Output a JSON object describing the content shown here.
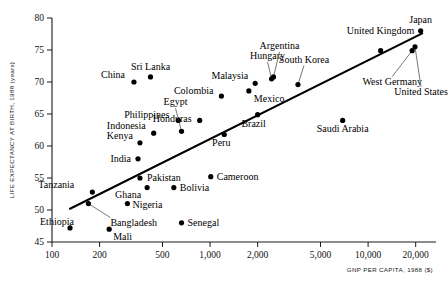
{
  "chart_data": {
    "type": "scatter",
    "title": "",
    "xlabel": "GNP PER CAPITA, 1988 ($)",
    "ylabel": "LIFE EXPECTANCY AT BIRTH, 1988 (years)",
    "xscale": "log",
    "xlim": [
      100,
      25000
    ],
    "ylim": [
      45,
      80
    ],
    "xticks": [
      100,
      200,
      500,
      1000,
      2000,
      5000,
      10000,
      20000
    ],
    "xticklabels": [
      "100",
      "200",
      "500",
      "1,000",
      "2,000",
      "5,000",
      "10,000",
      "20,000"
    ],
    "yticks": [
      45,
      50,
      55,
      60,
      65,
      70,
      75,
      80
    ],
    "yticklabels": [
      "45",
      "50",
      "55",
      "60",
      "65",
      "70",
      "75",
      "80"
    ],
    "grid": false,
    "legend": false,
    "trendline": {
      "label": "fitted line",
      "x0": 130,
      "y0": 50.2,
      "x1": 22000,
      "y1": 77.6
    },
    "points": [
      {
        "label": "Ethiopia",
        "x": 130,
        "y": 47.2,
        "label_dx": -30,
        "label_dy": -3,
        "anchor": "start",
        "leader": false
      },
      {
        "label": "Mali",
        "x": 230,
        "y": 47.0,
        "label_dx": 4,
        "label_dy": 11,
        "anchor": "start",
        "leader": false
      },
      {
        "label": "Bangladesh",
        "x": 170,
        "y": 51.0,
        "label_dx": 22,
        "label_dy": 22,
        "anchor": "start",
        "leader": true
      },
      {
        "label": "Tanzania",
        "x": 180,
        "y": 52.8,
        "label_dx": -54,
        "label_dy": -4,
        "anchor": "start",
        "leader": false
      },
      {
        "label": "Nigeria",
        "x": 300,
        "y": 51.0,
        "label_dx": 5,
        "label_dy": 4,
        "anchor": "start",
        "leader": false
      },
      {
        "label": "Ghana",
        "x": 400,
        "y": 53.5,
        "label_dx": -6,
        "label_dy": 10,
        "anchor": "end",
        "leader": false
      },
      {
        "label": "Senegal",
        "x": 660,
        "y": 48.0,
        "label_dx": 6,
        "label_dy": 3,
        "anchor": "start",
        "leader": false
      },
      {
        "label": "Bolivia",
        "x": 590,
        "y": 53.5,
        "label_dx": 6,
        "label_dy": 3,
        "anchor": "start",
        "leader": false
      },
      {
        "label": "Pakistan",
        "x": 360,
        "y": 55.0,
        "label_dx": 7,
        "label_dy": 3,
        "anchor": "start",
        "leader": false
      },
      {
        "label": "India",
        "x": 350,
        "y": 58.0,
        "label_dx": -7,
        "label_dy": 3,
        "anchor": "end",
        "leader": false
      },
      {
        "label": "Cameroon",
        "x": 1010,
        "y": 55.2,
        "label_dx": 6,
        "label_dy": 3,
        "anchor": "start",
        "leader": false
      },
      {
        "label": "Kenya",
        "x": 360,
        "y": 60.5,
        "label_dx": -7,
        "label_dy": -4,
        "anchor": "end",
        "leader": false
      },
      {
        "label": "Indonesia",
        "x": 440,
        "y": 62.0,
        "label_dx": -8,
        "label_dy": -4,
        "anchor": "end",
        "leader": false
      },
      {
        "label": "Philippines",
        "x": 630,
        "y": 64.0,
        "label_dx": -9,
        "label_dy": -2,
        "anchor": "end",
        "leader": false
      },
      {
        "label": "Egypt",
        "x": 660,
        "y": 62.3,
        "label_dx": -6,
        "label_dy": -26,
        "anchor": "middle",
        "leader": true
      },
      {
        "label": "China",
        "x": 330,
        "y": 70.0,
        "label_dx": -9,
        "label_dy": -4,
        "anchor": "end",
        "leader": false
      },
      {
        "label": "Sri Lanka",
        "x": 420,
        "y": 70.8,
        "label_dx": 0,
        "label_dy": -7,
        "anchor": "middle",
        "leader": false
      },
      {
        "label": "Honduras",
        "x": 860,
        "y": 64.0,
        "label_dx": -8,
        "label_dy": 2,
        "anchor": "end",
        "leader": false
      },
      {
        "label": "Colombia",
        "x": 1180,
        "y": 67.8,
        "label_dx": -8,
        "label_dy": -2,
        "anchor": "end",
        "leader": false
      },
      {
        "label": "Peru",
        "x": 1230,
        "y": 61.8,
        "label_dx": -3,
        "label_dy": 12,
        "anchor": "middle",
        "leader": false
      },
      {
        "label": "Brazil",
        "x": 2000,
        "y": 64.9,
        "label_dx": -4,
        "label_dy": 12,
        "anchor": "middle",
        "leader": false
      },
      {
        "label": "Mexico",
        "x": 1760,
        "y": 68.6,
        "label_dx": 5,
        "label_dy": 11,
        "anchor": "start",
        "leader": false
      },
      {
        "label": "Malaysia",
        "x": 1930,
        "y": 69.8,
        "label_dx": -7,
        "label_dy": -4,
        "anchor": "end",
        "leader": false
      },
      {
        "label": "Hungary",
        "x": 2450,
        "y": 70.5,
        "label_dx": -4,
        "label_dy": -20,
        "anchor": "middle",
        "leader": true
      },
      {
        "label": "Argentina",
        "x": 2520,
        "y": 70.8,
        "label_dx": 6,
        "label_dy": -28,
        "anchor": "middle",
        "leader": true
      },
      {
        "label": "South Korea",
        "x": 3600,
        "y": 69.6,
        "label_dx": 6,
        "label_dy": -22,
        "anchor": "middle",
        "leader": true
      },
      {
        "label": "Saudi Arabia",
        "x": 6900,
        "y": 64.0,
        "label_dx": 0,
        "label_dy": 12,
        "anchor": "middle",
        "leader": false
      },
      {
        "label": "United Kingdom",
        "x": 12000,
        "y": 74.9,
        "label_dx": 0,
        "label_dy": -17,
        "anchor": "middle",
        "leader": false
      },
      {
        "label": "West Germany",
        "x": 19000,
        "y": 74.9,
        "label_dx": -20,
        "label_dy": 34,
        "anchor": "middle",
        "leader": true
      },
      {
        "label": "United States",
        "x": 19800,
        "y": 75.5,
        "label_dx": 6,
        "label_dy": 48,
        "anchor": "middle",
        "leader": true
      },
      {
        "label": "Japan",
        "x": 21500,
        "y": 78.0,
        "label_dx": 0,
        "label_dy": -8,
        "anchor": "middle",
        "leader": false
      }
    ]
  }
}
